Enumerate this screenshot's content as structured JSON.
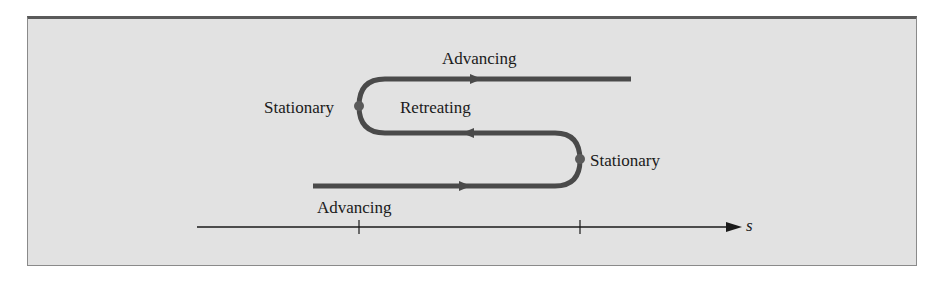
{
  "diagram": {
    "type": "motion-path",
    "colors": {
      "background": "#e2e2e2",
      "path": "#4a4a4a",
      "marker": "#5a5a5a",
      "axis": "#1a1a1a",
      "text": "#1a1a1a"
    },
    "labels": {
      "advancing_top": "Advancing",
      "stationary_left": "Stationary",
      "retreating": "Retreating",
      "stationary_right": "Stationary",
      "advancing_bottom": "Advancing"
    },
    "axis": {
      "label": "s",
      "ticks": 2
    },
    "segments": [
      {
        "name": "bottom",
        "state": "Advancing",
        "direction": "right"
      },
      {
        "name": "right-turn",
        "state": "Stationary"
      },
      {
        "name": "middle",
        "state": "Retreating",
        "direction": "left"
      },
      {
        "name": "left-turn",
        "state": "Stationary"
      },
      {
        "name": "top",
        "state": "Advancing",
        "direction": "right"
      }
    ]
  }
}
